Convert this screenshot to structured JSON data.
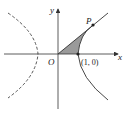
{
  "diagram": {
    "type": "hyperbola-area",
    "labels": {
      "x_axis": "x",
      "y_axis": "y",
      "origin": "O",
      "point_p": "P",
      "vertex": "(1, 0)"
    },
    "colors": {
      "curve": "#333333",
      "shade": "#9a9a9a",
      "axis": "#333333"
    }
  }
}
